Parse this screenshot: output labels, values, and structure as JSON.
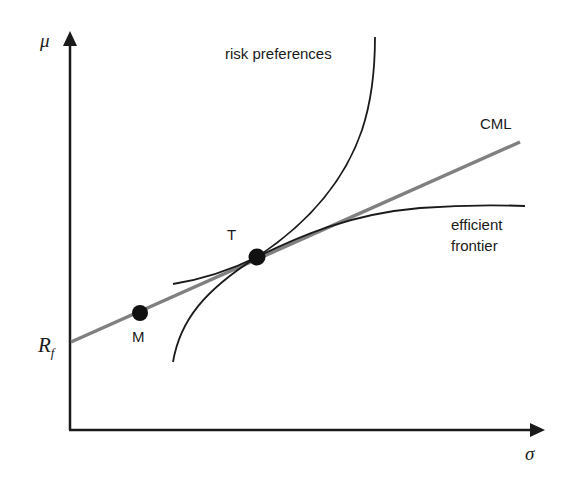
{
  "diagram": {
    "type": "capital-market-line-diagram",
    "axes": {
      "y_label": "μ",
      "x_label": "σ",
      "y_intercept_label_main": "R",
      "y_intercept_label_sub": "f"
    },
    "curves": {
      "cml_label": "CML",
      "risk_preferences_label": "risk preferences",
      "efficient_frontier_label_line1": "efficient",
      "efficient_frontier_label_line2": "frontier"
    },
    "points": {
      "market_label": "M",
      "tangency_label": "T"
    },
    "colors": {
      "axis": "#1a1a1a",
      "curve": "#1a1a1a",
      "cml": "#808080",
      "point": "#111111"
    }
  }
}
